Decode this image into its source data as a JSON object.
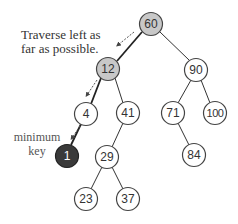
{
  "diagram": {
    "colors": {
      "edge": "#222222",
      "node_fill": "#ffffff",
      "node_stroke": "#333333",
      "path_fill": "#c8c8c8",
      "min_fill": "#3a3a3a",
      "min_text": "#ffffff",
      "text": "#333333",
      "arrow": "#555555"
    },
    "annotations": {
      "traverse_line1": "Traverse left as",
      "traverse_line2": "far as possible.",
      "minimum_line1": "minimum",
      "minimum_line2": "key"
    },
    "nodes": [
      {
        "id": "n60",
        "label": "60",
        "x": 151,
        "y": 24,
        "style": "path"
      },
      {
        "id": "n12",
        "label": "12",
        "x": 108,
        "y": 69,
        "style": "path"
      },
      {
        "id": "n90",
        "label": "90",
        "x": 196,
        "y": 70,
        "style": "normal"
      },
      {
        "id": "n4",
        "label": "4",
        "x": 86,
        "y": 114,
        "style": "normal"
      },
      {
        "id": "n41",
        "label": "41",
        "x": 128,
        "y": 113,
        "style": "normal"
      },
      {
        "id": "n71",
        "label": "71",
        "x": 173,
        "y": 113,
        "style": "normal"
      },
      {
        "id": "n100",
        "label": "100",
        "x": 215,
        "y": 113,
        "style": "normal"
      },
      {
        "id": "n1",
        "label": "1",
        "x": 67,
        "y": 156,
        "style": "min"
      },
      {
        "id": "n29",
        "label": "29",
        "x": 107,
        "y": 157,
        "style": "normal"
      },
      {
        "id": "n84",
        "label": "84",
        "x": 194,
        "y": 155,
        "style": "normal"
      },
      {
        "id": "n23",
        "label": "23",
        "x": 86,
        "y": 199,
        "style": "normal"
      },
      {
        "id": "n37",
        "label": "37",
        "x": 128,
        "y": 199,
        "style": "normal"
      }
    ],
    "edges": [
      {
        "from": "60",
        "to": "12",
        "highlight": true
      },
      {
        "from": "60",
        "to": "90",
        "highlight": false
      },
      {
        "from": "12",
        "to": "4",
        "highlight": true
      },
      {
        "from": "12",
        "to": "41",
        "highlight": false
      },
      {
        "from": "90",
        "to": "71",
        "highlight": false
      },
      {
        "from": "90",
        "to": "100",
        "highlight": false
      },
      {
        "from": "4",
        "to": "1",
        "highlight": true
      },
      {
        "from": "41",
        "to": "29",
        "highlight": false
      },
      {
        "from": "71",
        "to": "84",
        "highlight": false
      },
      {
        "from": "29",
        "to": "23",
        "highlight": false
      },
      {
        "from": "29",
        "to": "37",
        "highlight": false
      }
    ]
  }
}
